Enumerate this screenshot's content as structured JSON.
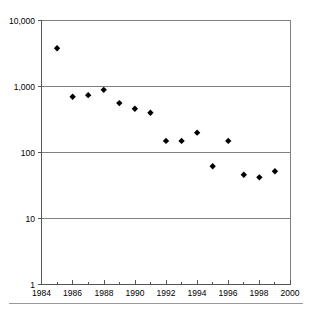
{
  "chart_data": {
    "type": "scatter",
    "title": "",
    "subtitle": "",
    "xlabel": "",
    "ylabel": "",
    "yscale": "log",
    "xscale": "linear",
    "xlim": [
      1984,
      2000
    ],
    "ylim": [
      1,
      10000
    ],
    "grid": true,
    "legend": null,
    "legend_position": "none",
    "marker_style": "diamond",
    "marker_color": "#000000",
    "x": [
      1985,
      1986,
      1987,
      1988,
      1989,
      1990,
      1991,
      1992,
      1993,
      1994,
      1995,
      1996,
      1997,
      1998,
      1999
    ],
    "values": [
      3800,
      700,
      740,
      890,
      560,
      460,
      400,
      150,
      150,
      200,
      62,
      150,
      46,
      42,
      52
    ],
    "points": [
      {
        "x": 1985,
        "y": 3800
      },
      {
        "x": 1986,
        "y": 700
      },
      {
        "x": 1987,
        "y": 740
      },
      {
        "x": 1988,
        "y": 890
      },
      {
        "x": 1989,
        "y": 560
      },
      {
        "x": 1990,
        "y": 460
      },
      {
        "x": 1991,
        "y": 400
      },
      {
        "x": 1992,
        "y": 150
      },
      {
        "x": 1993,
        "y": 150
      },
      {
        "x": 1994,
        "y": 200
      },
      {
        "x": 1995,
        "y": 62
      },
      {
        "x": 1996,
        "y": 150
      },
      {
        "x": 1997,
        "y": 46
      },
      {
        "x": 1998,
        "y": 42
      },
      {
        "x": 1999,
        "y": 52
      }
    ],
    "ytick_values": [
      1,
      10,
      100,
      1000,
      10000
    ],
    "ytick_labels": [
      "1",
      "10",
      "100",
      "1,000",
      "10,000"
    ],
    "xtick_values": [
      1984,
      1986,
      1988,
      1990,
      1992,
      1994,
      1996,
      1998,
      2000
    ],
    "xtick_labels": [
      "1984",
      "1986",
      "1988",
      "1990",
      "1992",
      "1994",
      "1996",
      "1998",
      "2000"
    ],
    "xminor_ticks": [
      1984,
      1985,
      1986,
      1987,
      1988,
      1989,
      1990,
      1991,
      1992,
      1993,
      1994,
      1995,
      1996,
      1997,
      1998,
      1999,
      2000
    ]
  },
  "axes": {
    "y_labels": {
      "t0": "10,000",
      "t1": "1,000",
      "t2": "100",
      "t3": "10",
      "t4": "1"
    },
    "x_labels": {
      "t0": "1984",
      "t1": "1986",
      "t2": "1988",
      "t3": "1990",
      "t4": "1992",
      "t5": "1994",
      "t6": "1996",
      "t7": "1998",
      "t8": "2000"
    }
  },
  "colors": {
    "gridline": "#808080",
    "axis": "#555555",
    "marker": "#000000",
    "footer_rule": "#9a9a9a",
    "background": "#ffffff"
  }
}
